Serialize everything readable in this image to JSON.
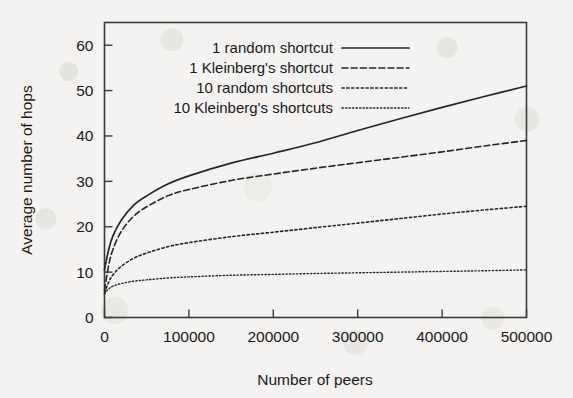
{
  "figure": {
    "background_color": "#f4f3f1",
    "ink_color": "#262624"
  },
  "chart_data": {
    "type": "line",
    "title": "",
    "xlabel": "Number of peers",
    "ylabel": "Average number of hops",
    "xlim": [
      0,
      500000
    ],
    "ylim": [
      0,
      65
    ],
    "xticks": [
      0,
      100000,
      200000,
      300000,
      400000,
      500000
    ],
    "xtick_labels": [
      "0",
      "100000",
      "200000",
      "300000",
      "400000",
      "500000"
    ],
    "yticks": [
      0,
      10,
      20,
      30,
      40,
      50,
      60
    ],
    "ytick_labels": [
      "0",
      "10",
      "20",
      "30",
      "40",
      "50",
      "60"
    ],
    "grid": false,
    "legend_position": "top-center-inside",
    "x": [
      0,
      5000,
      10000,
      20000,
      35000,
      50000,
      75000,
      100000,
      150000,
      200000,
      250000,
      300000,
      350000,
      400000,
      450000,
      500000
    ],
    "series": [
      {
        "name": "1 random shortcut",
        "linestyle": "solid",
        "color": "#262624",
        "values": [
          10.5,
          15.0,
          18.0,
          21.5,
          24.8,
          26.8,
          29.4,
          31.2,
          34.0,
          36.2,
          38.5,
          41.2,
          43.8,
          46.3,
          48.7,
          51.0
        ]
      },
      {
        "name": "1 Kleinberg's shortcut",
        "linestyle": "dashed",
        "color": "#262624",
        "values": [
          6.0,
          11.5,
          15.0,
          19.0,
          22.4,
          24.4,
          26.8,
          28.2,
          30.2,
          31.6,
          32.9,
          34.1,
          35.3,
          36.5,
          37.8,
          39.0
        ]
      },
      {
        "name": "10 random shortcuts",
        "linestyle": "dotted",
        "color": "#262624",
        "values": [
          5.4,
          7.8,
          9.4,
          11.3,
          13.1,
          14.2,
          15.6,
          16.5,
          17.8,
          18.8,
          19.8,
          20.8,
          21.8,
          22.8,
          23.7,
          24.5
        ]
      },
      {
        "name": "10 Kleinberg's shortcuts",
        "linestyle": "fine-dotted",
        "color": "#262624",
        "values": [
          5.2,
          6.3,
          6.9,
          7.5,
          8.0,
          8.3,
          8.7,
          8.95,
          9.3,
          9.5,
          9.7,
          9.85,
          10.0,
          10.15,
          10.3,
          10.5
        ]
      }
    ]
  },
  "legend": {
    "entries": [
      {
        "label": "1 random shortcut",
        "style": "solid"
      },
      {
        "label": "1 Kleinberg's shortcut",
        "style": "dashed"
      },
      {
        "label": "10 random shortcuts",
        "style": "dotted"
      },
      {
        "label": "10 Kleinberg's shortcuts",
        "style": "fine-dotted"
      }
    ]
  }
}
